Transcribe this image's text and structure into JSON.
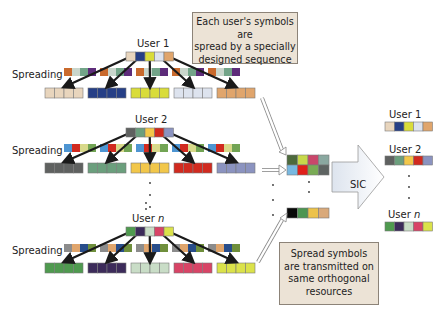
{
  "callouts": {
    "top": {
      "lines": [
        "Each user's symbols are",
        "spread by a specially",
        "designed sequence"
      ]
    },
    "bottom": {
      "lines": [
        "Spread symbols",
        "are transmitted on",
        "same orthogonal",
        "resources"
      ]
    }
  },
  "labels": {
    "spreading": "Spreading",
    "sic": "SIC",
    "users": [
      "User 1",
      "User 2",
      "User n"
    ]
  },
  "users": [
    {
      "name": "User 1",
      "symbols": [
        "#e8d5bd",
        "#263f86",
        "#d9dc3a",
        "#dde3ee",
        "#e0a56c"
      ],
      "spreading_sequence": [
        "#c96a2d",
        "#c9d6cc",
        "#72a488",
        "#5d2c7a"
      ]
    },
    {
      "name": "User 2",
      "symbols": [
        "#5f6160",
        "#6b9f7d",
        "#f2c74a",
        "#d12a1f",
        "#8b93c0"
      ],
      "spreading_sequence": [
        "#4e95d2",
        "#d12a1f",
        "#d8d98a",
        "#72a454"
      ]
    },
    {
      "name": "User n",
      "symbols": [
        "#4f9a4f",
        "#3c2b5a",
        "#c9ddc7",
        "#d84466",
        "#dbe24a"
      ],
      "spreading_sequence": [
        "#8c8c8c",
        "#e0a56c",
        "#284d8a",
        "#6f8f3c"
      ]
    }
  ],
  "resources": {
    "row1": [
      "#4d6a3c",
      "#c7d84a",
      "#c9476b",
      "#8aa8a0"
    ],
    "row2": [
      "#78b8e0",
      "#e0201a",
      "#79ab55",
      "#5e6462"
    ],
    "rown": [
      "#080808",
      "#4d9552",
      "#ecc24a",
      "#d9a97a"
    ]
  },
  "outputs": [
    {
      "name": "User 1",
      "symbols": [
        "#e8d5bd",
        "#263f86",
        "#d9dc3a",
        "#dde3ee",
        "#e0a56c"
      ]
    },
    {
      "name": "User 2",
      "symbols": [
        "#5f6160",
        "#6b9f7d",
        "#f2c74a",
        "#d12a1f",
        "#8b93c0"
      ]
    },
    {
      "name": "User n",
      "symbols": [
        "#4f9a4f",
        "#3c2b5a",
        "#c9ddc7",
        "#d84466",
        "#dbe24a"
      ]
    }
  ],
  "colors": {
    "callout_bg": "#ece3d6",
    "callout_border": "#8c8378",
    "arrow": "#1a1a1a"
  }
}
